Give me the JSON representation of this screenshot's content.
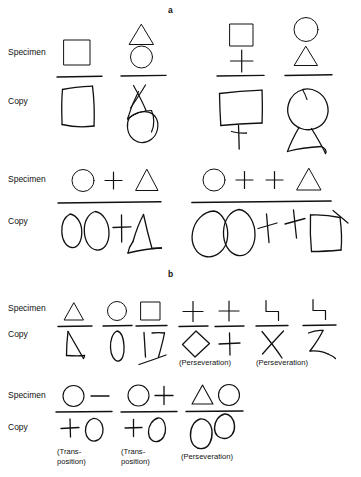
{
  "figure": {
    "ink_color": "#111111",
    "background_color": "#ffffff",
    "panels": [
      {
        "letter": "a",
        "letter_pos": {
          "x": 170,
          "y": 8
        },
        "blocks": [
          {
            "specimen_label": "Specimen",
            "copy_label": "Copy",
            "specimen_label_pos": {
              "x": 8,
              "y": 51
            },
            "copy_label_pos": {
              "x": 8,
              "y": 100
            },
            "items": [
              {
                "specimen": "square",
                "copy": "bowed-square"
              },
              {
                "specimen": "triangle-over-circle",
                "copy": "scribbled-triangle-circle"
              },
              {
                "specimen": "square-over-plus",
                "copy": "square-with-stem-plus"
              },
              {
                "specimen": "circle-over-triangle",
                "copy": "circle-with-body-triangle"
              }
            ]
          },
          {
            "specimen_label": "Specimen",
            "copy_label": "Copy",
            "specimen_label_pos": {
              "x": 8,
              "y": 177
            },
            "copy_label_pos": {
              "x": 8,
              "y": 219
            },
            "items": [
              {
                "specimen": "circle plus triangle",
                "copy": "two ovals, plus, open triangle"
              },
              {
                "specimen": "circle plus plus triangle",
                "copy": "two large ovals, two crosses, quadrilateral"
              }
            ]
          }
        ]
      },
      {
        "letter": "b",
        "letter_pos": {
          "x": 170,
          "y": 272
        },
        "blocks": [
          {
            "specimen_label": "Specimen",
            "copy_label": "Copy",
            "specimen_label_pos": {
              "x": 8,
              "y": 305
            },
            "copy_label_pos": {
              "x": 8,
              "y": 331
            },
            "items": [
              {
                "specimen": "triangle",
                "copy": "open-triangle",
                "note": null
              },
              {
                "specimen": "circle",
                "copy": "narrow-oval",
                "note": null
              },
              {
                "specimen": "square",
                "copy": "broken-square-strokes",
                "note": null
              },
              {
                "specimen": "plus",
                "copy": "diamond",
                "note": "(Perseveration)"
              },
              {
                "specimen": "plus",
                "copy": "plus",
                "note": null
              },
              {
                "specimen": "step-bracket",
                "copy": "x-cross",
                "note": "(Perseveration)"
              },
              {
                "specimen": "step-bracket",
                "copy": "z-shape",
                "note": null
              }
            ]
          },
          {
            "specimen_label": "Specimen",
            "copy_label": "Copy",
            "specimen_label_pos": {
              "x": 8,
              "y": 393
            },
            "copy_label_pos": {
              "x": 8,
              "y": 425
            },
            "items": [
              {
                "specimen": "circle dash",
                "copy": "plus circle",
                "note": "(Trans-\nposition)"
              },
              {
                "specimen": "circle plus",
                "copy": "plus oval",
                "note": "(Trans-\nposition)"
              },
              {
                "specimen": "triangle circle",
                "copy": "oval oval",
                "note": "(Perseveration)"
              }
            ]
          }
        ]
      }
    ],
    "notes": [
      {
        "text": "(Perseveration)",
        "x": 184,
        "y": 349
      },
      {
        "text": "(Perseveration)",
        "x": 271,
        "y": 349
      },
      {
        "text": "(Trans-",
        "x": 59,
        "y": 443
      },
      {
        "text": "position)",
        "x": 59,
        "y": 452
      },
      {
        "text": "(Trans-",
        "x": 122,
        "y": 443
      },
      {
        "text": "position)",
        "x": 122,
        "y": 452
      },
      {
        "text": "(Perseveration)",
        "x": 182,
        "y": 448
      }
    ],
    "row_labels": [
      {
        "text": "Specimen",
        "x": 8,
        "y": 51
      },
      {
        "text": "Copy",
        "x": 8,
        "y": 100
      },
      {
        "text": "Specimen",
        "x": 8,
        "y": 177
      },
      {
        "text": "Copy",
        "x": 8,
        "y": 219
      },
      {
        "text": "Specimen",
        "x": 8,
        "y": 305
      },
      {
        "text": "Copy",
        "x": 8,
        "y": 331
      },
      {
        "text": "Specimen",
        "x": 8,
        "y": 393
      },
      {
        "text": "Copy",
        "x": 8,
        "y": 425
      }
    ],
    "panel_letters": [
      {
        "text": "a",
        "x": 170,
        "y": 8
      },
      {
        "text": "b",
        "x": 170,
        "y": 272
      }
    ]
  }
}
